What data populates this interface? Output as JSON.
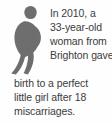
{
  "card": {
    "kind": "illustrated-factoid",
    "background_color": "#fefefe",
    "text_color": "#3c3c3c",
    "accent_color": "#6e6e6e"
  },
  "illustration": {
    "icon_name": "pregnant-woman-silhouette-icon",
    "fill_color": "#6e6e6e",
    "alt_text": "Silhouette of a pregnant woman"
  },
  "factoid": {
    "full_text": "In 2010, a 33-year-old woman from Brighton gave birth to a perfect little girl after 18 miscarriages.",
    "lines_beside_figure": [
      "In 2010, a",
      "33-year-old",
      "woman from",
      "Brighton gave"
    ],
    "lines_full_width": [
      "birth to a perfect",
      "little girl after 18",
      "miscarriages."
    ],
    "year": "2010",
    "age": "33-year-old",
    "location": "Brighton",
    "miscarriage_count": "18"
  }
}
